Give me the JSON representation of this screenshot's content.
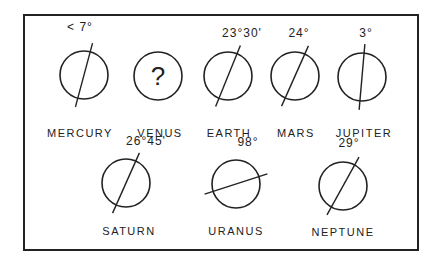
{
  "planets": [
    {
      "name": "MERCURY",
      "tilt": "< 7°",
      "cx": 84,
      "cy": 75,
      "tilt_deg": 15,
      "unknown": false
    },
    {
      "name": "VENUS",
      "tilt": "",
      "cx": 158,
      "cy": 76,
      "tilt_deg": 0,
      "unknown": true,
      "symbol": "?"
    },
    {
      "name": "EARTH",
      "tilt": "23°30'",
      "cx": 228,
      "cy": 76,
      "tilt_deg": 22,
      "unknown": false
    },
    {
      "name": "MARS",
      "tilt": "24°",
      "cx": 295,
      "cy": 76,
      "tilt_deg": 24,
      "unknown": false
    },
    {
      "name": "JUPITER",
      "tilt": "3°",
      "cx": 362,
      "cy": 77,
      "tilt_deg": 5,
      "unknown": false
    },
    {
      "name": "SATURN",
      "tilt": "26°45'",
      "cx": 126,
      "cy": 183,
      "tilt_deg": 24,
      "unknown": false
    },
    {
      "name": "URANUS",
      "tilt": "98°",
      "cx": 236,
      "cy": 184,
      "tilt_deg": 72,
      "unknown": false
    },
    {
      "name": "NEPTUNE",
      "tilt": "29°",
      "cx": 343,
      "cy": 186,
      "tilt_deg": 29,
      "unknown": false
    }
  ]
}
